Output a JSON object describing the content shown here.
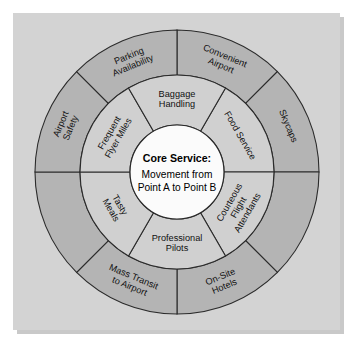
{
  "diagram": {
    "type": "concentric-ring-service-wheel",
    "geometry": {
      "center_x": 177,
      "center_y": 172,
      "core_radius": 47,
      "inner_ring_outer_radius": 97,
      "outer_ring_outer_radius": 142
    },
    "colors": {
      "panel_background": "#d3d3d3",
      "outer_ring_fill": "#b4b4b4",
      "inner_ring_fill": "#d0d0d0",
      "core_fill": "#fbfbfb",
      "stroke": "#2b2b2b",
      "text": "#111111"
    },
    "core": {
      "title": "Core Service:",
      "lines": [
        "Movement from",
        "Point A to Point B"
      ]
    },
    "inner_ring": {
      "segment_count": 6,
      "segments": [
        {
          "label_lines": [
            "Food Service"
          ],
          "start_angle": -60,
          "end_angle": 0
        },
        {
          "label_lines": [
            "Courteous",
            "Flight",
            "Attendants"
          ],
          "start_angle": 0,
          "end_angle": 60
        },
        {
          "label_lines": [
            "Professional",
            "Pilots"
          ],
          "start_angle": 60,
          "end_angle": 120
        },
        {
          "label_lines": [
            "Tasty",
            "Meals"
          ],
          "start_angle": 120,
          "end_angle": 180
        },
        {
          "label_lines": [
            "Frequent",
            "Flyer Miles"
          ],
          "start_angle": 180,
          "end_angle": 240
        },
        {
          "label_lines": [
            "Baggage",
            "Handling"
          ],
          "start_angle": 240,
          "end_angle": 300
        }
      ]
    },
    "outer_ring": {
      "segment_count": 8,
      "segments": [
        {
          "label_lines": [
            "Convenient",
            "Airport"
          ],
          "start_angle": -90,
          "end_angle": -45
        },
        {
          "label_lines": [
            "Skycaps"
          ],
          "start_angle": -45,
          "end_angle": 0
        },
        {
          "label_lines": [],
          "start_angle": 0,
          "end_angle": 45
        },
        {
          "label_lines": [
            "On-Site",
            "Hotels"
          ],
          "start_angle": 45,
          "end_angle": 90
        },
        {
          "label_lines": [
            "Mass Transit",
            "to Airport"
          ],
          "start_angle": 90,
          "end_angle": 135
        },
        {
          "label_lines": [],
          "start_angle": 135,
          "end_angle": 180
        },
        {
          "label_lines": [
            "Airport",
            "Safety"
          ],
          "start_angle": 180,
          "end_angle": 225
        },
        {
          "label_lines": [
            "Parking",
            "Availability"
          ],
          "start_angle": 225,
          "end_angle": 270
        }
      ]
    }
  }
}
